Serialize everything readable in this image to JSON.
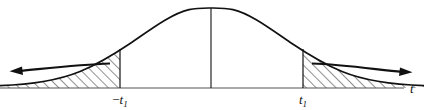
{
  "figure": {
    "name": "two-tailed-normal-distribution-rejection-regions",
    "background_color": "#ffffff",
    "stroke_color": "#111111",
    "hatch_color": "#222222",
    "width": 424,
    "height": 110
  },
  "axis": {
    "name": "horizontal-axis",
    "label": "t",
    "label_x": 410,
    "label_y": 93,
    "y": 88,
    "x_start": 0,
    "x_end": 404
  },
  "curve": {
    "name": "bell-curve",
    "type": "normal-density",
    "peak_x": 211,
    "peak_y": 8,
    "baseline_y": 88,
    "left_end_x": 0,
    "right_end_x": 424
  },
  "center_line": {
    "name": "center-vertical-line",
    "x": 211,
    "y_top": 8,
    "y_bottom": 88
  },
  "boundaries": [
    {
      "name": "left-critical-boundary",
      "label": "−t",
      "subscript": "1",
      "x": 120,
      "y_top": 50,
      "y_bottom": 88,
      "label_x": 120,
      "label_y": 103
    },
    {
      "name": "right-critical-boundary",
      "label": "t",
      "subscript": "1",
      "x": 303,
      "y_top": 50,
      "y_bottom": 88,
      "label_x": 303,
      "label_y": 103
    }
  ],
  "shaded_regions": [
    {
      "name": "left-tail-shaded-region",
      "side": "left",
      "hatch_angle_deg": 45,
      "from_x": 0,
      "to_x": 120
    },
    {
      "name": "right-tail-shaded-region",
      "side": "right",
      "hatch_angle_deg": 45,
      "from_x": 303,
      "to_x": 424
    }
  ],
  "arrows": [
    {
      "name": "left-tail-arrow",
      "direction": "left",
      "tip_x": 10,
      "tip_y": 71,
      "tail_x": 110,
      "tail_y": 64
    },
    {
      "name": "right-tail-arrow",
      "direction": "right",
      "tip_x": 412,
      "tip_y": 72,
      "tail_x": 312,
      "tail_y": 64
    }
  ]
}
